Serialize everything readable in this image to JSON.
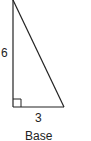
{
  "figure": {
    "type": "right-triangle",
    "labels": {
      "height": "6",
      "base": "3",
      "base_caption": "Base"
    },
    "right_angle_marker": true,
    "colors": {
      "stroke": "#222222",
      "text": "#222222",
      "background": "#ffffff"
    }
  }
}
